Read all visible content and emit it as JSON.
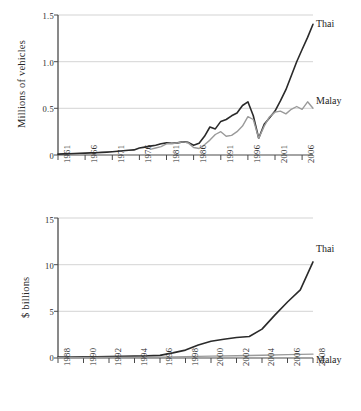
{
  "chart_data": [
    {
      "id": "vehicles",
      "type": "line",
      "title": "",
      "xlabel": "",
      "ylabel": "Millions of vehicles",
      "xlim": [
        1961,
        2008
      ],
      "ylim": [
        0,
        1.5
      ],
      "yticks": [
        "0",
        "0.5",
        "1.0",
        "1.5"
      ],
      "ytick_values": [
        0,
        0.5,
        1.0,
        1.5
      ],
      "xticks": [
        "1961",
        "1966",
        "1971",
        "1976",
        "1981",
        "1986",
        "1991",
        "1996",
        "2001",
        "2006"
      ],
      "xtick_values": [
        1961,
        1966,
        1971,
        1976,
        1981,
        1986,
        1991,
        1996,
        2001,
        2006
      ],
      "grid": "horizontal",
      "legend_position": "right-inline",
      "series": [
        {
          "name": "Thai",
          "color": "#2a2a2a",
          "x": [
            1961,
            1962,
            1963,
            1964,
            1965,
            1966,
            1967,
            1968,
            1969,
            1970,
            1971,
            1972,
            1973,
            1974,
            1975,
            1976,
            1977,
            1978,
            1979,
            1980,
            1981,
            1982,
            1983,
            1984,
            1985,
            1986,
            1987,
            1988,
            1989,
            1990,
            1991,
            1992,
            1993,
            1994,
            1995,
            1996,
            1997,
            1998,
            1999,
            2000,
            2001,
            2002,
            2003,
            2004,
            2005,
            2006,
            2007,
            2008
          ],
          "values": [
            0.01,
            0.012,
            0.014,
            0.016,
            0.018,
            0.02,
            0.022,
            0.025,
            0.028,
            0.031,
            0.035,
            0.04,
            0.045,
            0.05,
            0.055,
            0.075,
            0.085,
            0.095,
            0.105,
            0.12,
            0.13,
            0.125,
            0.13,
            0.14,
            0.135,
            0.105,
            0.125,
            0.2,
            0.3,
            0.28,
            0.36,
            0.38,
            0.42,
            0.45,
            0.53,
            0.57,
            0.42,
            0.18,
            0.33,
            0.4,
            0.47,
            0.58,
            0.7,
            0.85,
            1.0,
            1.13,
            1.26,
            1.4
          ]
        },
        {
          "name": "Malay",
          "color": "#9a9a9a",
          "x": [
            1978,
            1979,
            1980,
            1981,
            1982,
            1983,
            1984,
            1985,
            1986,
            1987,
            1988,
            1989,
            1990,
            1991,
            1992,
            1993,
            1994,
            1995,
            1996,
            1997,
            1998,
            1999,
            2000,
            2001,
            2002,
            2003,
            2004,
            2005,
            2006,
            2007,
            2008
          ],
          "values": [
            0.06,
            0.075,
            0.09,
            0.12,
            0.12,
            0.13,
            0.14,
            0.13,
            0.08,
            0.07,
            0.11,
            0.16,
            0.22,
            0.25,
            0.2,
            0.21,
            0.25,
            0.31,
            0.41,
            0.38,
            0.18,
            0.31,
            0.41,
            0.46,
            0.47,
            0.44,
            0.49,
            0.52,
            0.49,
            0.57,
            0.5
          ]
        }
      ]
    },
    {
      "id": "exports",
      "type": "line",
      "title": "",
      "xlabel": "",
      "ylabel": "$ billions",
      "xlim": [
        1988,
        2008
      ],
      "ylim": [
        0,
        15
      ],
      "yticks": [
        "0",
        "5",
        "10",
        "15"
      ],
      "ytick_values": [
        0,
        5,
        10,
        15
      ],
      "xticks": [
        "1988",
        "1990",
        "1992",
        "1994",
        "1996",
        "1998",
        "2000",
        "2002",
        "2004",
        "2006",
        "2008"
      ],
      "xtick_values": [
        1988,
        1990,
        1992,
        1994,
        1996,
        1998,
        2000,
        2002,
        2004,
        2006,
        2008
      ],
      "grid": "horizontal",
      "legend_position": "right-inline",
      "series": [
        {
          "name": "Thai",
          "color": "#2a2a2a",
          "x": [
            1988,
            1989,
            1990,
            1991,
            1992,
            1993,
            1994,
            1995,
            1996,
            1997,
            1998,
            1999,
            2000,
            2001,
            2002,
            2003,
            2004,
            2005,
            2006,
            2007,
            2008
          ],
          "values": [
            0.1,
            0.1,
            0.12,
            0.13,
            0.15,
            0.17,
            0.2,
            0.22,
            0.28,
            0.55,
            0.85,
            1.4,
            1.8,
            2.0,
            2.2,
            2.3,
            3.1,
            4.6,
            6.0,
            7.3,
            10.3
          ]
        },
        {
          "name": "Malay",
          "color": "#9a9a9a",
          "x": [
            1988,
            1990,
            1992,
            1994,
            1996,
            1998,
            2000,
            2002,
            2004,
            2006,
            2008
          ],
          "values": [
            0.04,
            0.05,
            0.06,
            0.07,
            0.09,
            0.15,
            0.2,
            0.24,
            0.3,
            0.36,
            0.42
          ]
        }
      ]
    }
  ],
  "top": {
    "ylabel": "Millions of vehicles",
    "yticks": [
      "1.5",
      "1.0",
      "0.5",
      "0"
    ],
    "xticks": [
      "1961",
      "1966",
      "1971",
      "1976",
      "1981",
      "1986",
      "1991",
      "1996",
      "2001",
      "2006"
    ],
    "series_labels": {
      "thai": "Thai",
      "malay": "Malay"
    }
  },
  "bottom": {
    "ylabel": "$ billions",
    "yticks": [
      "15",
      "10",
      "5",
      "0"
    ],
    "xticks": [
      "1988",
      "1990",
      "1992",
      "1994",
      "1996",
      "1998",
      "2000",
      "2002",
      "2004",
      "2006",
      "2008"
    ],
    "series_labels": {
      "thai": "Thai",
      "malay": "Malay"
    }
  },
  "colors": {
    "thai": "#2a2a2a",
    "malay": "#9a9a9a",
    "grid": "#c8c8c8",
    "axis": "#4a4a4a",
    "background": "#ffffff"
  }
}
